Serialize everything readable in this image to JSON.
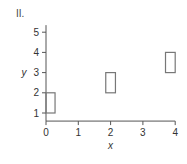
{
  "panel_label": "II.",
  "chart_data": {
    "type": "bar",
    "subtype": "floating-rectangles",
    "title": "",
    "panel": "II.",
    "xlabel": "x",
    "ylabel": "y",
    "xlim": [
      0,
      4
    ],
    "ylim": [
      0.6,
      5.35
    ],
    "xticks": [
      0,
      1,
      2,
      3,
      4
    ],
    "yticks": [
      1,
      2,
      3,
      4,
      5
    ],
    "grid": false,
    "legend": null,
    "rectangles": [
      {
        "x0": 0.0,
        "x1": 0.28,
        "y0": 1,
        "y1": 2
      },
      {
        "x0": 1.85,
        "x1": 2.15,
        "y0": 2,
        "y1": 3
      },
      {
        "x0": 3.7,
        "x1": 4.0,
        "y0": 3,
        "y1": 4
      }
    ],
    "colors": {
      "axis": "#555555",
      "rect_stroke": "#777777",
      "text": "#333333"
    }
  }
}
